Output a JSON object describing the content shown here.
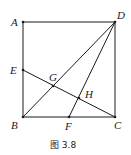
{
  "figure": {
    "caption": "图 3.8",
    "points": {
      "A": {
        "label": "A",
        "x": 23,
        "y": 22
      },
      "D": {
        "label": "D",
        "x": 115,
        "y": 22
      },
      "B": {
        "label": "B",
        "x": 23,
        "y": 117
      },
      "C": {
        "label": "C",
        "x": 115,
        "y": 117
      },
      "E": {
        "label": "E",
        "x": 23,
        "y": 70
      },
      "F": {
        "label": "F",
        "x": 69,
        "y": 117
      },
      "G": {
        "label": "G",
        "x": 53,
        "y": 86
      },
      "H": {
        "label": "H",
        "x": 79,
        "y": 98
      }
    },
    "segments": [
      "AD",
      "AB",
      "DC",
      "BC",
      "BD",
      "DF",
      "EC"
    ]
  }
}
